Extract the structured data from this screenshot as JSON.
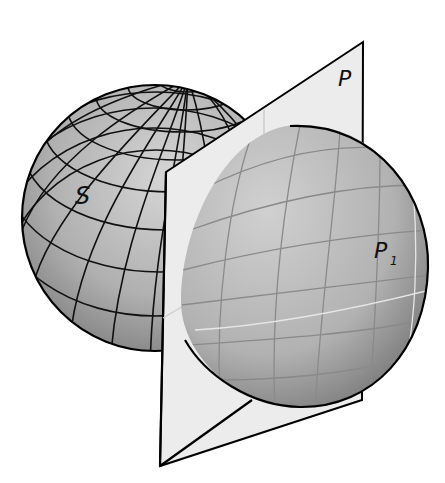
{
  "figure": {
    "type": "geometry-diagram",
    "labels": {
      "sphere": "S",
      "plane": "P",
      "piece": "P",
      "piece_subscript": "1"
    },
    "colors": {
      "sphere_fill": "#a9a9a9",
      "sphere_light": "#cfcfcf",
      "plane_fill": "#ececec",
      "piece_fill": "#b3b3b3",
      "grid_dark": "#111111",
      "grid_light": "#d8d8d8",
      "outline": "#000000"
    }
  }
}
